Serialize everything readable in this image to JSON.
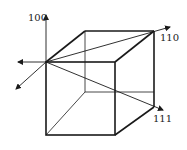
{
  "diagram": {
    "title": "",
    "labels": {
      "d100": "100",
      "d110": "110",
      "d111": "111"
    },
    "colors": {
      "stroke": "#1a1a1a",
      "background": "#ffffff"
    },
    "nodes": [
      {
        "id": "origin",
        "x": 46,
        "y": 62
      },
      {
        "id": "front-top-right",
        "x": 115,
        "y": 62
      },
      {
        "id": "front-bottom-left",
        "x": 46,
        "y": 135
      },
      {
        "id": "front-bottom-right",
        "x": 115,
        "y": 135
      },
      {
        "id": "back-top-left",
        "x": 85,
        "y": 31
      },
      {
        "id": "back-top-right",
        "x": 154,
        "y": 31
      },
      {
        "id": "back-bottom-left",
        "x": 85,
        "y": 92
      },
      {
        "id": "back-bottom-right",
        "x": 154,
        "y": 107
      }
    ],
    "directions": [
      {
        "label": "100",
        "from": "origin",
        "to": [
          46,
          15
        ]
      },
      {
        "label": "110",
        "from": "origin",
        "to": [
          170,
          27
        ]
      },
      {
        "label": "111",
        "from": "origin",
        "to": [
          163,
          110
        ]
      }
    ]
  }
}
